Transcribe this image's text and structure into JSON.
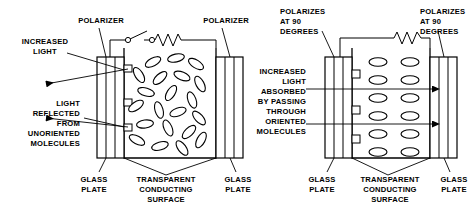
{
  "figure": {
    "stroke_color": "#000000",
    "background_color": "#ffffff"
  },
  "left_panel": {
    "name": "unpowered-lcd-cell",
    "switch_state": "open",
    "molecule_orientation": "random",
    "labels": {
      "polarizer_left": "POLARIZER",
      "polarizer_right": "POLARIZER",
      "increased_light": [
        "INCREASED",
        "LIGHT"
      ],
      "reflected": [
        "LIGHT",
        "REFLECTED",
        "FROM",
        "UNORIENTED",
        "MOLECULES"
      ],
      "glass_plate_left": [
        "GLASS",
        "PLATE"
      ],
      "glass_plate_right": [
        "GLASS",
        "PLATE"
      ],
      "conducting_surface": [
        "TRANSPARENT",
        "CONDUCTING",
        "SURFACE"
      ]
    },
    "molecules": [
      {
        "cx": 153,
        "cy": 62,
        "rx": 8.5,
        "ry": 4.0,
        "rot": -28
      },
      {
        "cx": 176,
        "cy": 58,
        "rx": 8.5,
        "ry": 4.0,
        "rot": -12
      },
      {
        "cx": 196,
        "cy": 64,
        "rx": 8.5,
        "ry": 4.0,
        "rot": 32
      },
      {
        "cx": 139,
        "cy": 75,
        "rx": 8.5,
        "ry": 4.0,
        "rot": 58
      },
      {
        "cx": 160,
        "cy": 78,
        "rx": 8.5,
        "ry": 4.0,
        "rot": -42
      },
      {
        "cx": 182,
        "cy": 76,
        "rx": 8.5,
        "ry": 4.0,
        "rot": 22
      },
      {
        "cx": 200,
        "cy": 84,
        "rx": 8.5,
        "ry": 4.0,
        "rot": 62
      },
      {
        "cx": 146,
        "cy": 92,
        "rx": 8.5,
        "ry": 4.0,
        "rot": 16
      },
      {
        "cx": 171,
        "cy": 93,
        "rx": 8.5,
        "ry": 4.0,
        "rot": -58
      },
      {
        "cx": 192,
        "cy": 100,
        "rx": 8.5,
        "ry": 4.0,
        "rot": 70
      },
      {
        "cx": 136,
        "cy": 106,
        "rx": 8.5,
        "ry": 4.0,
        "rot": -34
      },
      {
        "cx": 159,
        "cy": 110,
        "rx": 8.5,
        "ry": 4.0,
        "rot": 74
      },
      {
        "cx": 178,
        "cy": 112,
        "rx": 8.5,
        "ry": 4.0,
        "rot": -20
      },
      {
        "cx": 199,
        "cy": 118,
        "rx": 8.5,
        "ry": 4.0,
        "rot": 48
      },
      {
        "cx": 145,
        "cy": 124,
        "rx": 8.5,
        "ry": 4.0,
        "rot": -8
      },
      {
        "cx": 168,
        "cy": 128,
        "rx": 8.5,
        "ry": 4.0,
        "rot": 66
      },
      {
        "cx": 189,
        "cy": 132,
        "rx": 8.5,
        "ry": 4.0,
        "rot": -44
      },
      {
        "cx": 137,
        "cy": 140,
        "rx": 8.5,
        "ry": 4.0,
        "rot": 28
      },
      {
        "cx": 160,
        "cy": 146,
        "rx": 8.5,
        "ry": 4.0,
        "rot": -16
      },
      {
        "cx": 182,
        "cy": 148,
        "rx": 8.5,
        "ry": 4.0,
        "rot": 54
      },
      {
        "cx": 201,
        "cy": 140,
        "rx": 8.5,
        "ry": 4.0,
        "rot": -62
      }
    ]
  },
  "right_panel": {
    "name": "powered-lcd-cell",
    "switch_state": "closed",
    "molecule_orientation": "aligned-horizontal",
    "labels": {
      "polarizer_left": [
        "POLARIZES",
        "AT 90",
        "DEGREES"
      ],
      "polarizer_right": [
        "POLARIZES",
        "AT 90",
        "DEGREES"
      ],
      "absorbed": [
        "INCREASED",
        "LIGHT",
        "ABSORBED",
        "BY PASSING",
        "THROUGH",
        "ORIENTED",
        "MOLECULES"
      ],
      "glass_plate_left": [
        "GLASS",
        "PLATE"
      ],
      "glass_plate_right": [
        "GLASS",
        "PLATE"
      ],
      "conducting_surface": [
        "TRANSPARENT",
        "CONDUCTING",
        "SURFACE"
      ]
    },
    "molecules": [
      {
        "cx": 378,
        "cy": 62,
        "rx": 9.0,
        "ry": 4.2
      },
      {
        "cx": 410,
        "cy": 62,
        "rx": 9.0,
        "ry": 4.2
      },
      {
        "cx": 378,
        "cy": 80,
        "rx": 9.0,
        "ry": 4.2
      },
      {
        "cx": 410,
        "cy": 80,
        "rx": 9.0,
        "ry": 4.2
      },
      {
        "cx": 378,
        "cy": 98,
        "rx": 9.0,
        "ry": 4.2
      },
      {
        "cx": 410,
        "cy": 98,
        "rx": 9.0,
        "ry": 4.2
      },
      {
        "cx": 378,
        "cy": 116,
        "rx": 9.0,
        "ry": 4.2
      },
      {
        "cx": 410,
        "cy": 116,
        "rx": 9.0,
        "ry": 4.2
      },
      {
        "cx": 378,
        "cy": 134,
        "rx": 9.0,
        "ry": 4.2
      },
      {
        "cx": 410,
        "cy": 134,
        "rx": 9.0,
        "ry": 4.2
      },
      {
        "cx": 378,
        "cy": 152,
        "rx": 9.0,
        "ry": 4.2
      },
      {
        "cx": 410,
        "cy": 152,
        "rx": 9.0,
        "ry": 4.2
      }
    ]
  }
}
